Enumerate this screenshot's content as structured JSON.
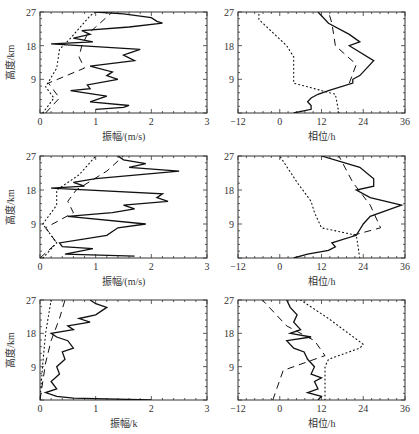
{
  "chart_data": [
    {
      "type": "line",
      "panel": "row1-left",
      "xlabel": "振幅/(m/s)",
      "ylabel": "高度/km",
      "xlim": [
        0,
        3
      ],
      "ylim": [
        0,
        27
      ],
      "xticks": [
        "0",
        "1",
        "2",
        "3"
      ],
      "yticks": [
        "9",
        "18",
        "27"
      ],
      "series": [
        {
          "name": "solid",
          "style": "solid",
          "points": [
            [
              1.0,
              1
            ],
            [
              1.5,
              1.5
            ],
            [
              1.6,
              2
            ],
            [
              0.9,
              3
            ],
            [
              1.2,
              4.5
            ],
            [
              0.75,
              5.5
            ],
            [
              0.55,
              6
            ],
            [
              0.9,
              6.5
            ],
            [
              0.85,
              7.5
            ],
            [
              1.4,
              9
            ],
            [
              1.2,
              10
            ],
            [
              1.3,
              11
            ],
            [
              0.9,
              12.5
            ],
            [
              1.7,
              14
            ],
            [
              1.5,
              15.5
            ],
            [
              1.6,
              16
            ],
            [
              1.8,
              17
            ],
            [
              0.2,
              18.5
            ],
            [
              0.95,
              19
            ],
            [
              0.6,
              20
            ],
            [
              0.9,
              21
            ],
            [
              0.75,
              22
            ],
            [
              1.6,
              23
            ],
            [
              2.2,
              24
            ],
            [
              2.1,
              24.5
            ],
            [
              2.0,
              25.5
            ],
            [
              1.5,
              26.5
            ],
            [
              1.0,
              27
            ]
          ]
        },
        {
          "name": "dashed",
          "style": "dashed",
          "points": [
            [
              0.1,
              0
            ],
            [
              0.35,
              4
            ],
            [
              0.15,
              8
            ],
            [
              0.8,
              12
            ],
            [
              0.7,
              15
            ],
            [
              0.75,
              18
            ],
            [
              0.85,
              21
            ],
            [
              1.0,
              23
            ],
            [
              1.3,
              27
            ]
          ]
        },
        {
          "name": "dotted",
          "style": "dotted",
          "points": [
            [
              0.05,
              0
            ],
            [
              0.25,
              4
            ],
            [
              0.1,
              7
            ],
            [
              0.3,
              12
            ],
            [
              0.35,
              17
            ],
            [
              0.55,
              20
            ],
            [
              0.9,
              26
            ],
            [
              1.0,
              27
            ]
          ]
        }
      ]
    },
    {
      "type": "line",
      "panel": "row1-right",
      "xlabel": "相位/h",
      "ylabel": "",
      "xlim": [
        -12,
        36
      ],
      "ylim": [
        0,
        27
      ],
      "xticks": [
        "-12",
        "0",
        "12",
        "24",
        "36"
      ],
      "yticks": [
        "9",
        "18",
        "27"
      ],
      "series": [
        {
          "name": "solid",
          "style": "solid",
          "points": [
            [
              4,
              0
            ],
            [
              9,
              1
            ],
            [
              9,
              2
            ],
            [
              8,
              3
            ],
            [
              9,
              4
            ],
            [
              11,
              5
            ],
            [
              14,
              6
            ],
            [
              21,
              8
            ],
            [
              21,
              9
            ],
            [
              23,
              10
            ],
            [
              27,
              14
            ],
            [
              20,
              18
            ],
            [
              23,
              19
            ],
            [
              20,
              21
            ],
            [
              14,
              24
            ],
            [
              11,
              27
            ]
          ]
        },
        {
          "name": "dashed",
          "style": "dashed",
          "points": [
            [
              20,
              8
            ],
            [
              22,
              13
            ],
            [
              16,
              18
            ],
            [
              15,
              24
            ],
            [
              14,
              27
            ]
          ]
        },
        {
          "name": "dotted",
          "style": "dotted",
          "points": [
            [
              17,
              0
            ],
            [
              16,
              5
            ],
            [
              4,
              8
            ],
            [
              4,
              15
            ],
            [
              2,
              18
            ],
            [
              -6,
              25
            ],
            [
              -6,
              27
            ]
          ]
        }
      ]
    },
    {
      "type": "line",
      "panel": "row2-left",
      "xlabel": "振幅/(m/s)",
      "ylabel": "高度/km",
      "xlim": [
        0,
        3
      ],
      "ylim": [
        0,
        27
      ],
      "xticks": [
        "0",
        "1",
        "2",
        "3"
      ],
      "yticks": [
        "9",
        "18",
        "27"
      ],
      "series": [
        {
          "name": "solid",
          "style": "solid",
          "points": [
            [
              1.7,
              0.5
            ],
            [
              0.45,
              1
            ],
            [
              0.95,
              2.5
            ],
            [
              0.4,
              3
            ],
            [
              0.35,
              4
            ],
            [
              1.2,
              6
            ],
            [
              1.4,
              8
            ],
            [
              1.9,
              9
            ],
            [
              0.5,
              11
            ],
            [
              1.3,
              12
            ],
            [
              1.7,
              13
            ],
            [
              1.5,
              14
            ],
            [
              2.3,
              15
            ],
            [
              2.1,
              16
            ],
            [
              2.2,
              17
            ],
            [
              0.2,
              18.5
            ],
            [
              0.8,
              19
            ],
            [
              0.6,
              20
            ],
            [
              1.0,
              21
            ],
            [
              2.5,
              23
            ],
            [
              1.6,
              24
            ],
            [
              1.9,
              25
            ],
            [
              1.5,
              26
            ],
            [
              1.4,
              27
            ]
          ]
        },
        {
          "name": "dashed",
          "style": "dashed",
          "points": [
            [
              0,
              0
            ],
            [
              0.3,
              4
            ],
            [
              0.1,
              8
            ],
            [
              0.6,
              12
            ],
            [
              0.5,
              15
            ],
            [
              0.65,
              18
            ],
            [
              1.2,
              23
            ],
            [
              1.5,
              27
            ]
          ]
        },
        {
          "name": "dotted",
          "style": "dotted",
          "points": [
            [
              0.05,
              0
            ],
            [
              0.3,
              4
            ],
            [
              0.05,
              9
            ],
            [
              0.3,
              14
            ],
            [
              0.3,
              18
            ],
            [
              0.7,
              22
            ],
            [
              1.0,
              27
            ]
          ]
        }
      ]
    },
    {
      "type": "line",
      "panel": "row2-right",
      "xlabel": "相位/h",
      "ylabel": "",
      "xlim": [
        -12,
        36
      ],
      "ylim": [
        0,
        27
      ],
      "xticks": [
        "-12",
        "0",
        "12",
        "24",
        "36"
      ],
      "yticks": [
        "9",
        "18",
        "27"
      ],
      "series": [
        {
          "name": "solid",
          "style": "solid",
          "points": [
            [
              4,
              0
            ],
            [
              8,
              1
            ],
            [
              14,
              2
            ],
            [
              16,
              3
            ],
            [
              15,
              4
            ],
            [
              22,
              6
            ],
            [
              24,
              9
            ],
            [
              26,
              11
            ],
            [
              35,
              14
            ],
            [
              26,
              16
            ],
            [
              22,
              18
            ],
            [
              27,
              19
            ],
            [
              27,
              21
            ],
            [
              23,
              24
            ],
            [
              12,
              27
            ]
          ]
        },
        {
          "name": "dashed",
          "style": "dashed",
          "points": [
            [
              21,
              6
            ],
            [
              29,
              8
            ],
            [
              26,
              14
            ],
            [
              21,
              20
            ],
            [
              17,
              27
            ]
          ]
        },
        {
          "name": "dotted",
          "style": "dotted",
          "points": [
            [
              23,
              0
            ],
            [
              22,
              6
            ],
            [
              12,
              8
            ],
            [
              10,
              12
            ],
            [
              9,
              15
            ],
            [
              5,
              20
            ],
            [
              0,
              27
            ]
          ]
        }
      ]
    },
    {
      "type": "line",
      "panel": "row3-left",
      "xlabel": "振幅/k",
      "ylabel": "高度/km",
      "xlim": [
        0,
        3
      ],
      "ylim": [
        0,
        27
      ],
      "xticks": [
        "0",
        "1",
        "2",
        "3"
      ],
      "yticks": [
        "9",
        "18",
        "27"
      ],
      "series": [
        {
          "name": "solid",
          "style": "solid",
          "points": [
            [
              2.0,
              0
            ],
            [
              0.6,
              0.5
            ],
            [
              0.3,
              1
            ],
            [
              0.1,
              2
            ],
            [
              0.3,
              3
            ],
            [
              0.2,
              5
            ],
            [
              0.35,
              7
            ],
            [
              0.3,
              9
            ],
            [
              0.45,
              11
            ],
            [
              0.4,
              13
            ],
            [
              0.6,
              14
            ],
            [
              0.5,
              16
            ],
            [
              0.3,
              17
            ],
            [
              0.2,
              18
            ],
            [
              0.6,
              19
            ],
            [
              0.5,
              20
            ],
            [
              0.9,
              21
            ],
            [
              0.7,
              22
            ],
            [
              1.0,
              23
            ],
            [
              1.1,
              24
            ],
            [
              1.2,
              25
            ],
            [
              1.0,
              26
            ],
            [
              0.9,
              27
            ]
          ]
        },
        {
          "name": "dashed",
          "style": "dashed",
          "points": [
            [
              0,
              0
            ],
            [
              0.05,
              5
            ],
            [
              0.1,
              10
            ],
            [
              0.2,
              16
            ],
            [
              0.35,
              22
            ],
            [
              0.45,
              27
            ]
          ]
        },
        {
          "name": "dotted",
          "style": "dotted",
          "points": [
            [
              0,
              0
            ],
            [
              0.05,
              10
            ],
            [
              0.1,
              18
            ],
            [
              0.2,
              27
            ]
          ]
        }
      ]
    },
    {
      "type": "line",
      "panel": "row3-right",
      "xlabel": "相位/h",
      "ylabel": "",
      "xlim": [
        -12,
        36
      ],
      "ylim": [
        0,
        27
      ],
      "xticks": [
        "-12",
        "0",
        "12",
        "24",
        "36"
      ],
      "yticks": [
        "9",
        "18",
        "27"
      ],
      "series": [
        {
          "name": "solid",
          "style": "solid",
          "points": [
            [
              11,
              0
            ],
            [
              12,
              1
            ],
            [
              8,
              2
            ],
            [
              11,
              3
            ],
            [
              10,
              5
            ],
            [
              12,
              6
            ],
            [
              9,
              7
            ],
            [
              10,
              9
            ],
            [
              8,
              11
            ],
            [
              7,
              13
            ],
            [
              4,
              14
            ],
            [
              2,
              16
            ],
            [
              9,
              17
            ],
            [
              3,
              18
            ],
            [
              6,
              19
            ],
            [
              4,
              21
            ],
            [
              5,
              23
            ],
            [
              3,
              25
            ],
            [
              2,
              27
            ]
          ]
        },
        {
          "name": "dashed",
          "style": "dashed",
          "points": [
            [
              -2,
              0
            ],
            [
              1,
              8
            ],
            [
              13,
              12
            ],
            [
              10,
              16
            ],
            [
              2,
              20
            ],
            [
              -5,
              27
            ]
          ]
        },
        {
          "name": "dotted",
          "style": "dotted",
          "points": [
            [
              13,
              0
            ],
            [
              13,
              5
            ],
            [
              13,
              9
            ],
            [
              14,
              11
            ],
            [
              23,
              14
            ],
            [
              24,
              15
            ],
            [
              14,
              22
            ],
            [
              6,
              27
            ]
          ]
        }
      ]
    }
  ]
}
